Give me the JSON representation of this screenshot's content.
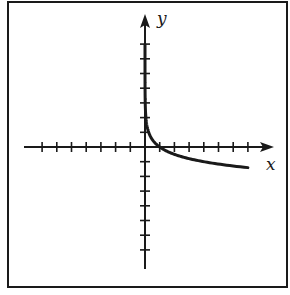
{
  "chart_data": {
    "type": "line",
    "title": "",
    "xlabel": "x",
    "ylabel": "y",
    "function": "y = log_{1/4}(x)",
    "xlim": [
      -8,
      8
    ],
    "ylim": [
      -8,
      8
    ],
    "x_ticks": [
      -7,
      -6,
      -5,
      -4,
      -3,
      -2,
      -1,
      1,
      2,
      3,
      4,
      5,
      6,
      7
    ],
    "y_ticks": [
      -7,
      -6,
      -5,
      -4,
      -3,
      -2,
      -1,
      1,
      2,
      3,
      4,
      5,
      6,
      7
    ],
    "tick_labels_shown": false,
    "grid": false,
    "series": [
      {
        "name": "curve",
        "x": [
          0.004,
          0.01,
          0.03,
          0.0625,
          0.125,
          0.25,
          0.5,
          1,
          2,
          3,
          4,
          5,
          6,
          7
        ],
        "y": [
          4.0,
          3.32,
          2.53,
          2.0,
          1.5,
          1.0,
          0.5,
          0,
          -0.5,
          -0.79,
          -1.0,
          -1.16,
          -1.29,
          -1.4
        ]
      }
    ],
    "axis_arrows": {
      "x_positive": true,
      "y_positive": true
    }
  },
  "labels": {
    "x_axis": "x",
    "y_axis": "y"
  },
  "colors": {
    "ink": "#1a1a1a",
    "background": "#ffffff"
  }
}
